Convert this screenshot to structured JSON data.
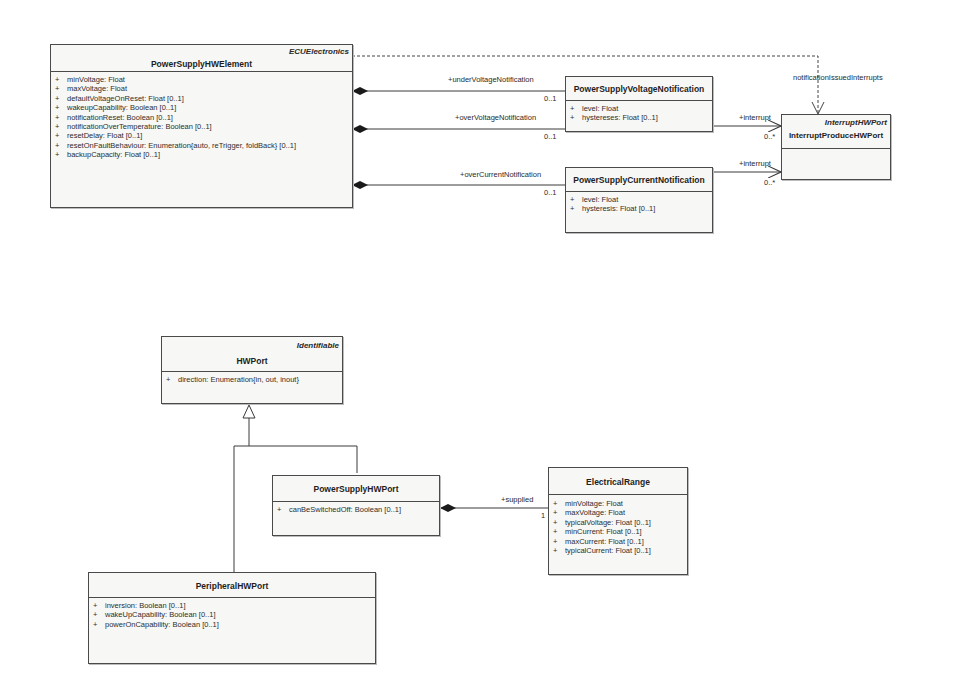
{
  "diagram": {
    "type": "UML class diagram",
    "classes": {
      "power_supply_hw_element": {
        "stereotype": "ECUElectronics",
        "name": "PowerSupplyHWElement",
        "attributes": [
          {
            "vis": "+",
            "text": "minVoltage: Float"
          },
          {
            "vis": "+",
            "text": "maxVoltage: Float"
          },
          {
            "vis": "+",
            "text": "defaultVoltageOnReset: Float [0..1]"
          },
          {
            "vis": "+",
            "text": "wakeupCapability: Boolean [0..1]"
          },
          {
            "vis": "+",
            "text": "notificationReset: Boolean [0..1]"
          },
          {
            "vis": "+",
            "text": "notificationOverTemperature: Boolean [0..1]"
          },
          {
            "vis": "+",
            "text": "resetDelay: Float [0..1]"
          },
          {
            "vis": "+",
            "text": "resetOnFaultBehaviour: Enumeration{auto, reTrigger, foldBack} [0..1]"
          },
          {
            "vis": "+",
            "text": "backupCapacity: Float [0..1]"
          }
        ]
      },
      "power_supply_voltage_notification": {
        "name": "PowerSupplyVoltageNotification",
        "attributes": [
          {
            "vis": "+",
            "text": "level: Float"
          },
          {
            "vis": "+",
            "text": "hystereses: Float [0..1]"
          }
        ]
      },
      "power_supply_current_notification": {
        "name": "PowerSupplyCurrentNotification",
        "attributes": [
          {
            "vis": "+",
            "text": "level: Float"
          },
          {
            "vis": "+",
            "text": "hysteresis: Float [0..1]"
          }
        ]
      },
      "interrupt_produce_hw_port": {
        "stereotype": "InterruptHWPort",
        "name": "InterruptProduceHWPort",
        "attributes": []
      },
      "hw_port": {
        "stereotype": "Identifiable",
        "name": "HWPort",
        "attributes": [
          {
            "vis": "+",
            "text": "direction: Enumeration{in, out, inout}"
          }
        ]
      },
      "power_supply_hw_port": {
        "name": "PowerSupplyHWPort",
        "attributes": [
          {
            "vis": "+",
            "text": "canBeSwitchedOff: Boolean [0..1]"
          }
        ]
      },
      "electrical_range": {
        "name": "ElectricalRange",
        "attributes": [
          {
            "vis": "+",
            "text": "minVoltage: Float"
          },
          {
            "vis": "+",
            "text": "maxVoltage: Float"
          },
          {
            "vis": "+",
            "text": "typicalVoltage: Float [0..1]"
          },
          {
            "vis": "+",
            "text": "minCurrent: Float [0..1]"
          },
          {
            "vis": "+",
            "text": "maxCurrent: Float [0..1]"
          },
          {
            "vis": "+",
            "text": "typicalCurrent: Float [0..1]"
          }
        ]
      },
      "peripheral_hw_port": {
        "name": "PeripheralHWPort",
        "attributes": [
          {
            "vis": "+",
            "text": "inversion: Boolean [0..1]"
          },
          {
            "vis": "+",
            "text": "wakeUpCapability: Boolean [0..1]"
          },
          {
            "vis": "+",
            "text": "powerOnCapability: Boolean [0..1]"
          }
        ]
      }
    },
    "associations": {
      "under_voltage": {
        "role": "+underVoltageNotification",
        "multiplicity": "0..1",
        "kind": "composition"
      },
      "over_voltage": {
        "role": "+overVoltageNotification",
        "multiplicity": "0..1",
        "kind": "composition"
      },
      "over_current": {
        "role": "+overCurrentNotification",
        "multiplicity": "0..1",
        "kind": "composition"
      },
      "voltage_interrupt": {
        "role": "+interrupt",
        "multiplicity": "0..*",
        "kind": "navigable association"
      },
      "current_interrupt": {
        "role": "+interrupt",
        "multiplicity": "0..*",
        "kind": "navigable association"
      },
      "notification_issued_interrupts": {
        "role": "notificationIssuedInterrupts",
        "kind": "dependency"
      },
      "supplied": {
        "role": "+supplied",
        "multiplicity": "1",
        "kind": "composition"
      },
      "generalization_power_supply": {
        "kind": "generalization",
        "from": "PowerSupplyHWPort",
        "to": "HWPort"
      },
      "generalization_peripheral": {
        "kind": "generalization",
        "from": "PeripheralHWPort",
        "to": "HWPort"
      }
    }
  }
}
